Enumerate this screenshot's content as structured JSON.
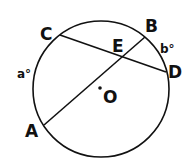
{
  "diagram": {
    "type": "circle-intersecting-chords",
    "circle": {
      "center_label": "O",
      "cx": 101,
      "cy": 89,
      "r": 68
    },
    "points": {
      "A": {
        "label": "A",
        "x": 44,
        "y": 125
      },
      "B": {
        "label": "B",
        "x": 145,
        "y": 37
      },
      "C": {
        "label": "C",
        "x": 60,
        "y": 35
      },
      "D": {
        "label": "D",
        "x": 166,
        "y": 72
      },
      "E": {
        "label": "E"
      }
    },
    "chords": [
      "AB",
      "CD"
    ],
    "arcs": {
      "a": {
        "label": "a°",
        "arc": "AC"
      },
      "b": {
        "label": "b°",
        "arc": "BD"
      }
    },
    "colors": {
      "stroke": "#111111",
      "background": "#ffffff"
    }
  }
}
